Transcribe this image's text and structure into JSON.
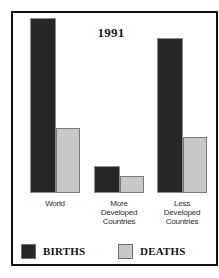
{
  "chart_data": {
    "type": "bar",
    "title": "1991",
    "xlabel": "",
    "ylabel": "",
    "categories": [
      "World",
      "More\nDeveloped\nCountries",
      "Less\nDeveloped\nCountries"
    ],
    "category_labels": [
      "World",
      "More Developed Countries",
      "Less Developed Countries"
    ],
    "series": [
      {
        "name": "BIRTHS",
        "color": "#262626",
        "values": [
          175,
          27,
          155
        ]
      },
      {
        "name": "DEATHS",
        "color": "#c8c8c8",
        "values": [
          65,
          17,
          56
        ]
      }
    ],
    "ylim": [
      0,
      185
    ],
    "grid": false,
    "axis_ticks_visible": false,
    "legend_position": "bottom"
  },
  "legend": {
    "births_label": "BIRTHS",
    "deaths_label": "DEATHS"
  },
  "colors": {
    "births": "#262626",
    "deaths": "#c8c8c8",
    "frame": "#111111",
    "background": "#ffffff",
    "text": "#1a1a1a"
  }
}
